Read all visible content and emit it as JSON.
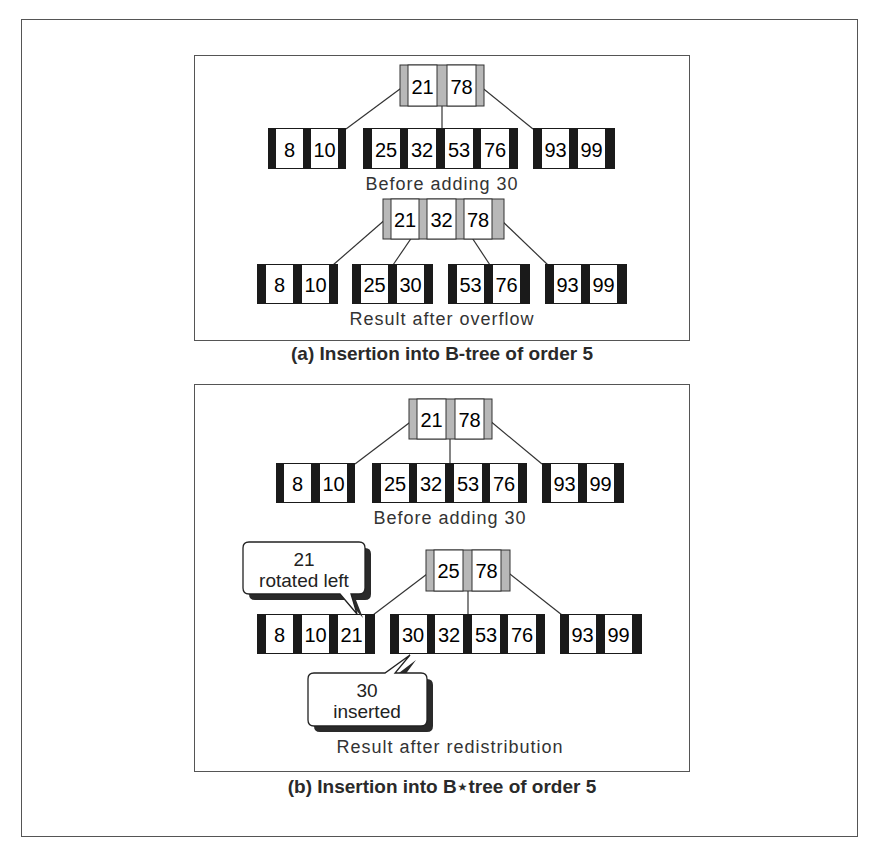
{
  "figure": {
    "panels": [
      {
        "id": "a",
        "caption": "(a) Insertion into B-tree of order 5",
        "trees": [
          {
            "label": "Before adding 30",
            "root": {
              "keys": [
                "21",
                "78"
              ]
            },
            "leaves": [
              {
                "keys": [
                  "8",
                  "10"
                ]
              },
              {
                "keys": [
                  "25",
                  "32",
                  "53",
                  "76"
                ]
              },
              {
                "keys": [
                  "93",
                  "99"
                ]
              }
            ]
          },
          {
            "label": "Result after overflow",
            "root": {
              "keys": [
                "21",
                "32",
                "78"
              ]
            },
            "leaves": [
              {
                "keys": [
                  "8",
                  "10"
                ]
              },
              {
                "keys": [
                  "25",
                  "30"
                ]
              },
              {
                "keys": [
                  "53",
                  "76"
                ]
              },
              {
                "keys": [
                  "93",
                  "99"
                ]
              }
            ]
          }
        ]
      },
      {
        "id": "b",
        "caption": "(b) Insertion into B⋆tree of order 5",
        "trees": [
          {
            "label": "Before adding 30",
            "root": {
              "keys": [
                "21",
                "78"
              ]
            },
            "leaves": [
              {
                "keys": [
                  "8",
                  "10"
                ]
              },
              {
                "keys": [
                  "25",
                  "32",
                  "53",
                  "76"
                ]
              },
              {
                "keys": [
                  "93",
                  "99"
                ]
              }
            ]
          },
          {
            "label": "Result after redistribution",
            "root": {
              "keys": [
                "25",
                "78"
              ]
            },
            "leaves": [
              {
                "keys": [
                  "8",
                  "10",
                  "21"
                ]
              },
              {
                "keys": [
                  "30",
                  "32",
                  "53",
                  "76"
                ]
              },
              {
                "keys": [
                  "93",
                  "99"
                ]
              }
            ],
            "callouts": [
              {
                "line1": "21",
                "line2": "rotated left"
              },
              {
                "line1": "30",
                "line2": "inserted"
              }
            ]
          }
        ]
      }
    ]
  },
  "colors": {
    "frame": "#555555",
    "leaf_pointer": "#1a1a1a",
    "root_pointer": "#b8b8b8",
    "key_fill": "#ffffff",
    "text": "#222222",
    "shadow": "#2a2a2a"
  }
}
